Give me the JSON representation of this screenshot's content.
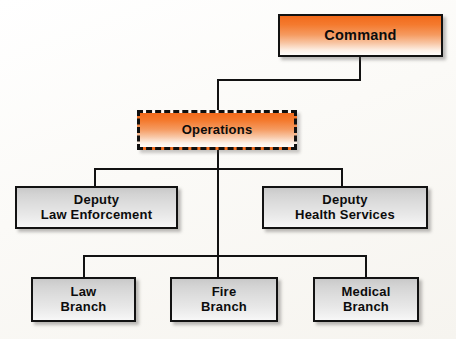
{
  "diagram": {
    "colors": {
      "accent_orange": "#f26a1b",
      "node_grey": "#dedede",
      "line": "#121212",
      "background": "#fdfcfa"
    },
    "nodes": [
      {
        "id": "command",
        "label": "Command",
        "style": "orange-solid",
        "level": 0
      },
      {
        "id": "operations",
        "label": "Operations",
        "style": "orange-dashed",
        "level": 1
      },
      {
        "id": "deputy-law-enforcement",
        "label": "Deputy\nLaw Enforcement",
        "style": "grey-solid",
        "level": 2
      },
      {
        "id": "deputy-health-services",
        "label": "Deputy\nHealth Services",
        "style": "grey-solid",
        "level": 2
      },
      {
        "id": "law-branch",
        "label": "Law\nBranch",
        "style": "grey-solid",
        "level": 3
      },
      {
        "id": "fire-branch",
        "label": "Fire\nBranch",
        "style": "grey-solid",
        "level": 3
      },
      {
        "id": "medical-branch",
        "label": "Medical\nBranch",
        "style": "grey-solid",
        "level": 3
      }
    ],
    "edges": [
      {
        "from": "command",
        "to": "operations"
      },
      {
        "from": "operations",
        "to": "deputy-law-enforcement"
      },
      {
        "from": "operations",
        "to": "deputy-health-services"
      },
      {
        "from": "operations",
        "to": "law-branch"
      },
      {
        "from": "operations",
        "to": "fire-branch"
      },
      {
        "from": "operations",
        "to": "medical-branch"
      }
    ]
  }
}
